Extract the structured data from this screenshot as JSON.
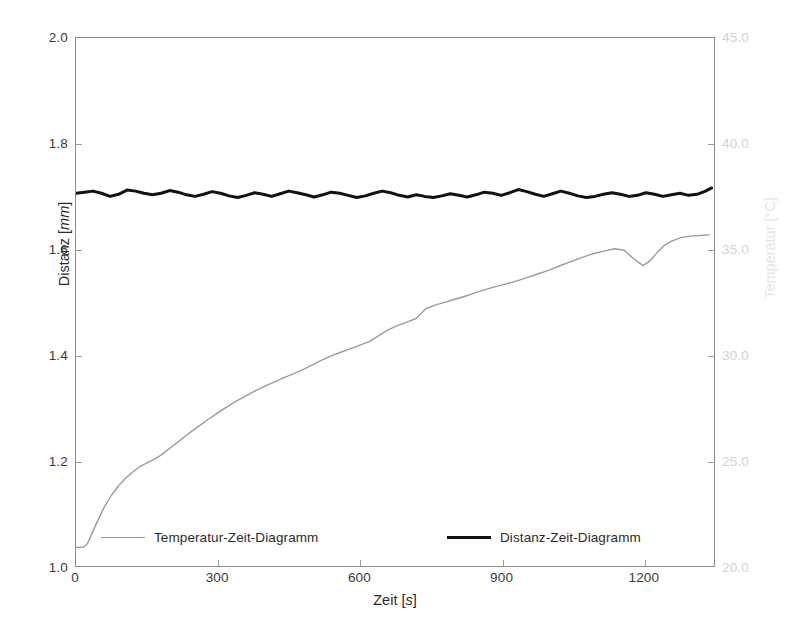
{
  "chart_data": {
    "type": "line",
    "title": "",
    "xlabel": "Zeit [s]",
    "xlabel_name": "Zeit",
    "xlabel_unit": "s",
    "ylabel_left": "Distanz [mm]",
    "ylabel_left_name": "Distanz",
    "ylabel_left_unit": "mm",
    "ylabel_right": "Temperatur [°C]",
    "ylabel_right_name": "Temperatur",
    "ylabel_right_unit": "°C",
    "xlim": [
      0,
      1350
    ],
    "xticks": [
      0,
      300,
      600,
      900,
      1200
    ],
    "xticklabels": [
      "0",
      "300",
      "600",
      "900",
      "1200"
    ],
    "ylim_left": [
      1.0,
      2.0
    ],
    "yticks_left": [
      1.0,
      1.2,
      1.4,
      1.6,
      1.8,
      2.0
    ],
    "yticklabels_left": [
      "1.0",
      "1.2",
      "1.4",
      "1.6",
      "1.8",
      "2.0"
    ],
    "ylim_right": [
      20.0,
      45.0
    ],
    "yticks_right": [
      20.0,
      25.0,
      30.0,
      35.0,
      40.0,
      45.0
    ],
    "yticklabels_right": [
      "20.0",
      "25.0",
      "30.0",
      "35.0",
      "40.0",
      "45.0"
    ],
    "grid": false,
    "legend_position": "bottom-inside",
    "colors": {
      "temperature_line": "#9b9b9b",
      "distance_line": "#111111",
      "axis": "#8c8c8c",
      "right_axis_text": "#d2d2d2",
      "background": "#ffffff"
    },
    "series": [
      {
        "name": "Temperatur-Zeit-Diagramm",
        "axis": "right",
        "color": "#9b9b9b",
        "linewidth": 1.4,
        "x": [
          0,
          8,
          16,
          24,
          32,
          45,
          60,
          75,
          90,
          105,
          120,
          135,
          150,
          165,
          180,
          200,
          220,
          240,
          260,
          280,
          300,
          320,
          340,
          360,
          380,
          400,
          420,
          440,
          460,
          480,
          500,
          520,
          540,
          560,
          580,
          600,
          620,
          640,
          660,
          680,
          700,
          720,
          740,
          760,
          780,
          800,
          820,
          840,
          860,
          880,
          900,
          920,
          940,
          960,
          980,
          1000,
          1020,
          1040,
          1060,
          1080,
          1100,
          1120,
          1140,
          1160,
          1180,
          1200,
          1215,
          1230,
          1245,
          1260,
          1280,
          1300,
          1320,
          1340
        ],
        "y_right": [
          20.88,
          20.88,
          20.9,
          21.05,
          21.45,
          22.1,
          22.8,
          23.35,
          23.8,
          24.15,
          24.45,
          24.7,
          24.88,
          25.05,
          25.25,
          25.6,
          25.95,
          26.3,
          26.62,
          26.95,
          27.25,
          27.55,
          27.82,
          28.05,
          28.3,
          28.52,
          28.72,
          28.92,
          29.1,
          29.3,
          29.52,
          29.75,
          29.95,
          30.12,
          30.28,
          30.45,
          30.62,
          30.9,
          31.18,
          31.38,
          31.55,
          31.72,
          32.18,
          32.35,
          32.48,
          32.62,
          32.75,
          32.9,
          33.05,
          33.18,
          33.3,
          33.42,
          33.55,
          33.7,
          33.85,
          34.0,
          34.18,
          34.35,
          34.52,
          34.68,
          34.82,
          34.92,
          35.02,
          34.95,
          34.55,
          34.22,
          34.45,
          34.85,
          35.18,
          35.38,
          35.55,
          35.62,
          35.65,
          35.68
        ],
        "y_left_equivalent": [
          1.035,
          1.035,
          1.036,
          1.042,
          1.058,
          1.084,
          1.112,
          1.134,
          1.152,
          1.166,
          1.178,
          1.188,
          1.195,
          1.202,
          1.21,
          1.224,
          1.238,
          1.252,
          1.265,
          1.278,
          1.29,
          1.302,
          1.313,
          1.322,
          1.332,
          1.341,
          1.349,
          1.357,
          1.364,
          1.372,
          1.381,
          1.39,
          1.398,
          1.405,
          1.411,
          1.418,
          1.425,
          1.436,
          1.447,
          1.455,
          1.462,
          1.469,
          1.487,
          1.494,
          1.499,
          1.505,
          1.51,
          1.516,
          1.522,
          1.527,
          1.532,
          1.537,
          1.542,
          1.548,
          1.554,
          1.56,
          1.567,
          1.574,
          1.581,
          1.587,
          1.593,
          1.597,
          1.601,
          1.598,
          1.582,
          1.569,
          1.578,
          1.594,
          1.607,
          1.615,
          1.622,
          1.625,
          1.626,
          1.627
        ]
      },
      {
        "name": "Distanz-Zeit-Diagramm",
        "axis": "left",
        "color": "#111111",
        "linewidth": 3.0,
        "x": [
          0,
          18,
          36,
          54,
          72,
          90,
          108,
          126,
          144,
          162,
          180,
          198,
          216,
          234,
          252,
          270,
          288,
          306,
          324,
          342,
          360,
          378,
          396,
          414,
          432,
          450,
          468,
          486,
          504,
          522,
          540,
          558,
          576,
          594,
          612,
          630,
          648,
          666,
          684,
          702,
          720,
          738,
          756,
          774,
          792,
          810,
          828,
          846,
          864,
          882,
          900,
          918,
          936,
          954,
          972,
          990,
          1008,
          1026,
          1044,
          1062,
          1080,
          1098,
          1116,
          1134,
          1152,
          1170,
          1188,
          1206,
          1224,
          1242,
          1260,
          1278,
          1296,
          1314,
          1332,
          1345
        ],
        "y_left": [
          1.706,
          1.708,
          1.71,
          1.706,
          1.7,
          1.704,
          1.712,
          1.71,
          1.706,
          1.703,
          1.706,
          1.711,
          1.708,
          1.703,
          1.7,
          1.704,
          1.709,
          1.706,
          1.701,
          1.698,
          1.702,
          1.707,
          1.704,
          1.7,
          1.705,
          1.71,
          1.707,
          1.703,
          1.699,
          1.703,
          1.708,
          1.706,
          1.702,
          1.698,
          1.701,
          1.706,
          1.71,
          1.707,
          1.702,
          1.699,
          1.703,
          1.7,
          1.698,
          1.701,
          1.705,
          1.702,
          1.699,
          1.703,
          1.708,
          1.706,
          1.702,
          1.707,
          1.713,
          1.709,
          1.704,
          1.7,
          1.705,
          1.71,
          1.706,
          1.701,
          1.698,
          1.7,
          1.704,
          1.707,
          1.704,
          1.7,
          1.702,
          1.707,
          1.704,
          1.7,
          1.703,
          1.706,
          1.702,
          1.704,
          1.71,
          1.716
        ]
      }
    ]
  },
  "legend": {
    "entries": [
      {
        "label": "Temperatur-Zeit-Diagramm"
      },
      {
        "label": "Distanz-Zeit-Diagramm"
      }
    ]
  }
}
